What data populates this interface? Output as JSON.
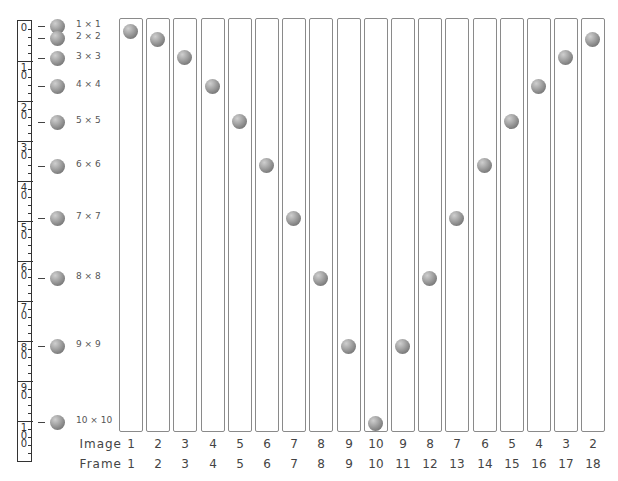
{
  "ruler": {
    "labels": [
      "0",
      "10",
      "20",
      "30",
      "40",
      "50",
      "60",
      "70",
      "80",
      "90",
      "100"
    ]
  },
  "legend": [
    {
      "label": "1 × 1",
      "y": 26
    },
    {
      "label": "2 × 2",
      "y": 38
    },
    {
      "label": "3 × 3",
      "y": 58
    },
    {
      "label": "4 × 4",
      "y": 86
    },
    {
      "label": "5 × 5",
      "y": 122
    },
    {
      "label": "6 × 6",
      "y": 166
    },
    {
      "label": "7 × 7",
      "y": 218
    },
    {
      "label": "8 × 8",
      "y": 278
    },
    {
      "label": "9 × 9",
      "y": 346
    },
    {
      "label": "10 × 10",
      "y": 422
    }
  ],
  "rows": {
    "image_label": "Image",
    "frame_label": "Frame"
  },
  "frames": [
    {
      "image": "1",
      "frame": "1",
      "ball_y": 31
    },
    {
      "image": "2",
      "frame": "2",
      "ball_y": 39
    },
    {
      "image": "3",
      "frame": "3",
      "ball_y": 57
    },
    {
      "image": "4",
      "frame": "4",
      "ball_y": 86
    },
    {
      "image": "5",
      "frame": "5",
      "ball_y": 121
    },
    {
      "image": "6",
      "frame": "6",
      "ball_y": 165
    },
    {
      "image": "7",
      "frame": "7",
      "ball_y": 218
    },
    {
      "image": "8",
      "frame": "8",
      "ball_y": 278
    },
    {
      "image": "9",
      "frame": "9",
      "ball_y": 346
    },
    {
      "image": "10",
      "frame": "10",
      "ball_y": 423
    },
    {
      "image": "9",
      "frame": "11",
      "ball_y": 346
    },
    {
      "image": "8",
      "frame": "12",
      "ball_y": 278
    },
    {
      "image": "7",
      "frame": "13",
      "ball_y": 218
    },
    {
      "image": "6",
      "frame": "14",
      "ball_y": 165
    },
    {
      "image": "5",
      "frame": "15",
      "ball_y": 121
    },
    {
      "image": "4",
      "frame": "16",
      "ball_y": 86
    },
    {
      "image": "3",
      "frame": "17",
      "ball_y": 57
    },
    {
      "image": "2",
      "frame": "18",
      "ball_y": 39
    }
  ],
  "colors": {
    "ball": "#8a8a8a",
    "column_border": "#8a8a8a",
    "ruler_border": "#333333"
  }
}
